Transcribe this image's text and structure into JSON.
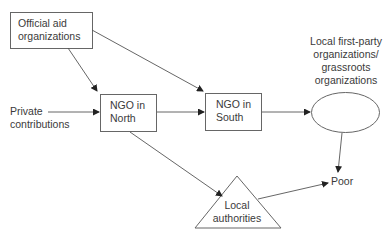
{
  "diagram": {
    "title": "",
    "nodes": [
      {
        "id": "official_aid",
        "shape": "rectangle",
        "lines": [
          "Official aid",
          "organizations"
        ]
      },
      {
        "id": "private",
        "shape": "text",
        "lines": [
          "Private",
          "contributions"
        ]
      },
      {
        "id": "ngo_north",
        "shape": "rectangle",
        "lines": [
          "NGO in",
          "North"
        ]
      },
      {
        "id": "ngo_south",
        "shape": "rectangle",
        "lines": [
          "NGO in",
          "South"
        ]
      },
      {
        "id": "local_grassroots",
        "shape": "ellipse",
        "lines": [
          "Local first-party",
          "organizations/",
          "grassroots",
          "organizations"
        ]
      },
      {
        "id": "local_authorities",
        "shape": "triangle",
        "lines": [
          "Local",
          "authorities"
        ]
      },
      {
        "id": "poor",
        "shape": "text",
        "lines": [
          "Poor"
        ]
      }
    ],
    "edges": [
      {
        "from": "official_aid",
        "to": "ngo_north"
      },
      {
        "from": "official_aid",
        "to": "ngo_south"
      },
      {
        "from": "private",
        "to": "ngo_north"
      },
      {
        "from": "ngo_north",
        "to": "ngo_south"
      },
      {
        "from": "ngo_north",
        "to": "local_authorities"
      },
      {
        "from": "ngo_south",
        "to": "local_grassroots"
      },
      {
        "from": "local_grassroots",
        "to": "poor"
      },
      {
        "from": "local_authorities",
        "to": "poor"
      }
    ],
    "colors": {
      "stroke": "#555555",
      "text": "#3a3a3a",
      "background": "#ffffff"
    }
  }
}
